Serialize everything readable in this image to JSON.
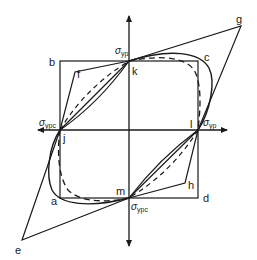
{
  "diagram": {
    "colors": {
      "line": "#1a1a1a",
      "background": "#ffffff"
    },
    "axes": {
      "vertical_top_label": {
        "symbol": "σ",
        "sub": "yp"
      },
      "left_label": {
        "symbol": "σ",
        "sub": "ypc"
      },
      "right_label": {
        "symbol": "σ",
        "sub": "yp"
      },
      "bottom_label": {
        "symbol": "σ",
        "sub": "ypc"
      }
    },
    "points": {
      "a": "a",
      "b": "b",
      "c": "c",
      "d": "d",
      "e": "e",
      "f": "f",
      "g": "g",
      "h": "h",
      "j": "j",
      "k": "k",
      "l": "l",
      "m": "m"
    }
  }
}
